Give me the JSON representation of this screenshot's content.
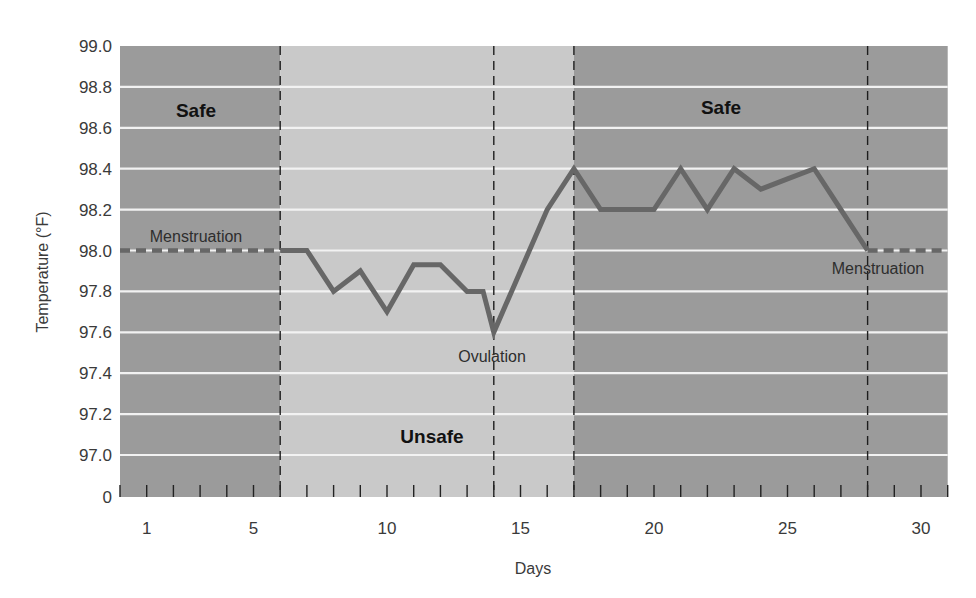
{
  "chart_data": {
    "type": "line",
    "title": "",
    "xlabel": "Days",
    "ylabel": "Temperature (°F)",
    "xlim": [
      0,
      31
    ],
    "ylim": [
      97.0,
      99.0
    ],
    "y_axis_break": true,
    "y_axis_zero_label": "0",
    "grid": {
      "horizontal": true,
      "vertical": false
    },
    "x_ticks": [
      1,
      2,
      3,
      4,
      5,
      6,
      7,
      8,
      9,
      10,
      11,
      12,
      13,
      14,
      15,
      16,
      17,
      18,
      19,
      20,
      21,
      22,
      23,
      24,
      25,
      26,
      27,
      28,
      29,
      30,
      31
    ],
    "x_tick_labels": [
      "1",
      "5",
      "10",
      "15",
      "20",
      "25",
      "30"
    ],
    "x_tick_label_values": [
      1,
      5,
      10,
      15,
      20,
      25,
      30
    ],
    "y_tick_labels": [
      "99.0",
      "98.8",
      "98.6",
      "98.4",
      "98.2",
      "98.0",
      "97.8",
      "97.6",
      "97.4",
      "97.2",
      "97.0",
      "0"
    ],
    "y_tick_values": [
      99.0,
      98.8,
      98.6,
      98.4,
      98.2,
      98.0,
      97.8,
      97.6,
      97.4,
      97.2,
      97.0
    ],
    "series": [
      {
        "name": "Basal body temperature",
        "style": "solid",
        "x": [
          6,
          7,
          8,
          9,
          10,
          11,
          12,
          13,
          13.6,
          14,
          15,
          16,
          17,
          18,
          19,
          20,
          21,
          22,
          23,
          24,
          25,
          26,
          27,
          28
        ],
        "values": [
          98.0,
          98.0,
          97.8,
          97.9,
          97.7,
          97.93,
          97.93,
          97.8,
          97.8,
          97.6,
          97.9,
          98.2,
          98.4,
          98.2,
          98.2,
          98.2,
          98.4,
          98.2,
          98.4,
          98.3,
          98.35,
          98.4,
          98.2,
          98.0
        ]
      },
      {
        "name": "Menstruation (start)",
        "style": "dashed",
        "x": [
          0,
          6
        ],
        "values": [
          98.0,
          98.0
        ]
      },
      {
        "name": "Menstruation (end)",
        "style": "dashed",
        "x": [
          28,
          31
        ],
        "values": [
          98.0,
          98.0
        ]
      }
    ],
    "regions": [
      {
        "label": "Safe",
        "x_start": 0,
        "x_end": 6,
        "shade": "dark"
      },
      {
        "label": "Unsafe",
        "x_start": 6,
        "x_end": 17,
        "shade": "light"
      },
      {
        "label": "Safe",
        "x_start": 17,
        "x_end": 31,
        "shade": "dark"
      }
    ],
    "vertical_dashed_lines": [
      6,
      14,
      17,
      28
    ],
    "annotations": [
      {
        "text": "Menstruation",
        "x": 3,
        "y": 98.08
      },
      {
        "text": "Ovulation",
        "x": 15,
        "y": 97.48
      },
      {
        "text": "Menstruation",
        "x": 29.5,
        "y": 97.92
      },
      {
        "text": "Safe",
        "x": 3,
        "y": 98.72
      },
      {
        "text": "Unsafe",
        "x": 12,
        "y": 97.1
      },
      {
        "text": "Safe",
        "x": 22.5,
        "y": 98.72
      }
    ],
    "legend": null
  },
  "labels": {
    "xlabel": "Days",
    "ylabel": "Temperature (°F)",
    "zone_safe_left": "Safe",
    "zone_unsafe": "Unsafe",
    "zone_safe_right": "Safe",
    "annot_menstruation_left": "Menstruation",
    "annot_ovulation": "Ovulation",
    "annot_menstruation_right": "Menstruation"
  },
  "colors": {
    "safe_region": "#9b9b9b",
    "unsafe_region": "#c9c9c9",
    "gridline": "#f2f2f2",
    "data_line": "#676767",
    "dashed_marker": "#1e1e1e",
    "text": "#3a3a3a"
  }
}
